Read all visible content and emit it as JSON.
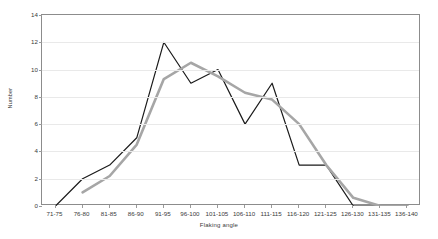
{
  "chart_data": {
    "type": "line",
    "title": "",
    "xlabel": "Flaking angle",
    "ylabel": "Number",
    "categories": [
      "71-75",
      "76-80",
      "81-85",
      "86-90",
      "91-95",
      "96-100",
      "101-105",
      "106-110",
      "111-115",
      "116-120",
      "121-125",
      "126-130",
      "131-135",
      "136-140"
    ],
    "ylim": [
      0,
      14
    ],
    "yticks": [
      0,
      2,
      4,
      6,
      8,
      10,
      12,
      14
    ],
    "grid": true,
    "legend": "none",
    "series": [
      {
        "name": "black-series",
        "color": "#1a1a1a",
        "values": [
          0,
          2,
          3,
          5,
          12,
          9,
          10,
          6,
          9,
          3,
          3,
          0,
          0,
          0
        ]
      },
      {
        "name": "gray-series",
        "color": "#a6a6a6",
        "values": [
          null,
          1,
          2.2,
          4.5,
          9.3,
          10.5,
          9.5,
          8.3,
          7.8,
          6,
          3,
          0.6,
          0,
          0
        ]
      }
    ]
  }
}
